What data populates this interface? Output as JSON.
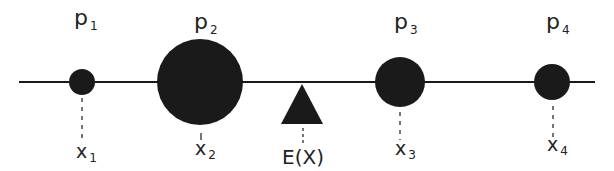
{
  "diagram": {
    "colors": {
      "ink": "#1a1a1a",
      "label": "#222222",
      "background": "#ffffff"
    },
    "axis": {
      "x1": 19,
      "x2": 595,
      "y": 82
    },
    "masses": [
      {
        "id": "p1",
        "prob_label": "p",
        "prob_sub": "1",
        "value_label": "x",
        "value_sub": "1",
        "cx": 82,
        "r": 13
      },
      {
        "id": "p2",
        "prob_label": "p",
        "prob_sub": "2",
        "value_label": "x",
        "value_sub": "2",
        "cx": 200,
        "r": 43
      },
      {
        "id": "p3",
        "prob_label": "p",
        "prob_sub": "3",
        "value_label": "x",
        "value_sub": "3",
        "cx": 400,
        "r": 25
      },
      {
        "id": "p4",
        "prob_label": "p",
        "prob_sub": "4",
        "value_label": "x",
        "value_sub": "4",
        "cx": 552,
        "r": 18
      }
    ],
    "fulcrum": {
      "label": "E(X)",
      "cx": 302,
      "apex_y": 84,
      "base_y": 124,
      "half_width": 21,
      "shape": "triangle-icon"
    }
  }
}
